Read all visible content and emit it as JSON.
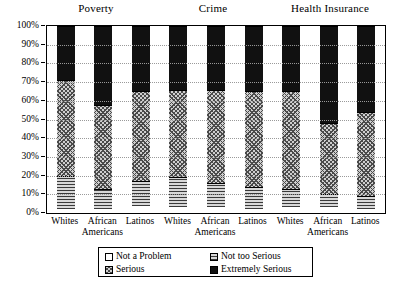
{
  "chart_data": {
    "type": "bar",
    "subtype": "stacked-bar-100",
    "title": "",
    "xlabel": "",
    "ylabel": "",
    "ylim": [
      0,
      100
    ],
    "ytick_labels": [
      "0%",
      "10%",
      "20%",
      "30%",
      "40%",
      "50%",
      "60%",
      "70%",
      "80%",
      "90%",
      "100%"
    ],
    "ytick_values": [
      0,
      10,
      20,
      30,
      40,
      50,
      60,
      70,
      80,
      90,
      100
    ],
    "grid": true,
    "legend_position": "bottom",
    "legend": [
      "Not a Problem",
      "Not too Serious",
      "Serious",
      "Extremely Serious"
    ],
    "groups": [
      "Poverty",
      "Crime",
      "Health Insurance"
    ],
    "categories": [
      "Whites",
      "African Americans",
      "Latinos",
      "Whites",
      "African Americans",
      "Latinos",
      "Whites",
      "African Americans",
      "Latinos"
    ],
    "series": [
      {
        "name": "Not a Problem",
        "values": [
          2,
          2,
          4,
          3,
          3,
          2,
          3,
          3,
          2
        ]
      },
      {
        "name": "Not too Serious",
        "values": [
          18,
          11,
          13,
          16,
          13,
          12,
          10,
          7,
          7
        ]
      },
      {
        "name": "Serious",
        "values": [
          51,
          45,
          48,
          47,
          50,
          51,
          52,
          38,
          45
        ]
      },
      {
        "name": "Extremely Serious",
        "values": [
          29,
          42,
          35,
          34,
          34,
          35,
          35,
          52,
          46
        ]
      }
    ]
  },
  "groups": [
    {
      "title": "Poverty"
    },
    {
      "title": "Crime"
    },
    {
      "title": "Health Insurance"
    }
  ],
  "xlabels": [
    {
      "line1": "Whites",
      "line2": ""
    },
    {
      "line1": "African",
      "line2": "Americans"
    },
    {
      "line1": "Latinos",
      "line2": ""
    },
    {
      "line1": "Whites",
      "line2": ""
    },
    {
      "line1": "African",
      "line2": "Americans"
    },
    {
      "line1": "Latinos",
      "line2": ""
    },
    {
      "line1": "Whites",
      "line2": ""
    },
    {
      "line1": "African",
      "line2": "Americans"
    },
    {
      "line1": "Latinos",
      "line2": ""
    }
  ],
  "legend": {
    "items": [
      {
        "label": "Not a Problem",
        "pattern": "none",
        "color": "#ffffff"
      },
      {
        "label": "Not too Serious",
        "pattern": "hlines",
        "color": "#8d8d8d"
      },
      {
        "label": "Serious",
        "pattern": "crosshatch",
        "color": "#cfcfcf"
      },
      {
        "label": "Extremely Serious",
        "pattern": "solid",
        "color": "#111111"
      }
    ]
  },
  "axis": {
    "ticks": [
      {
        "label": "100%",
        "value": 100
      },
      {
        "label": "90%",
        "value": 90
      },
      {
        "label": "80%",
        "value": 80
      },
      {
        "label": "70%",
        "value": 70
      },
      {
        "label": "60%",
        "value": 60
      },
      {
        "label": "50%",
        "value": 50
      },
      {
        "label": "40%",
        "value": 40
      },
      {
        "label": "30%",
        "value": 30
      },
      {
        "label": "20%",
        "value": 20
      },
      {
        "label": "10%",
        "value": 10
      },
      {
        "label": "0%",
        "value": 0
      }
    ]
  }
}
